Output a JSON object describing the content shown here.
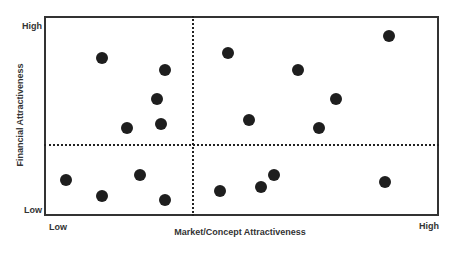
{
  "chart_data": {
    "type": "scatter",
    "title": "",
    "xlabel": "Market/Concept Attractiveness",
    "ylabel": "Financial Attractiveness",
    "x_tick_labels": {
      "low": "Low",
      "high": "High"
    },
    "y_tick_labels": {
      "low": "Low",
      "high": "High"
    },
    "xlim": [
      0,
      10
    ],
    "ylim": [
      0,
      10
    ],
    "grid": false,
    "legend": null,
    "quadrant_dividers": {
      "x": 3.76,
      "y": 3.55,
      "style": "dotted"
    },
    "points": [
      {
        "x": 1.47,
        "y": 7.9
      },
      {
        "x": 3.06,
        "y": 7.3
      },
      {
        "x": 2.86,
        "y": 5.85
      },
      {
        "x": 2.96,
        "y": 4.6
      },
      {
        "x": 2.1,
        "y": 4.4
      },
      {
        "x": 4.66,
        "y": 8.15
      },
      {
        "x": 6.43,
        "y": 7.3
      },
      {
        "x": 7.39,
        "y": 5.85
      },
      {
        "x": 5.19,
        "y": 4.8
      },
      {
        "x": 6.96,
        "y": 4.4
      },
      {
        "x": 8.73,
        "y": 9.0
      },
      {
        "x": 0.56,
        "y": 1.8
      },
      {
        "x": 1.47,
        "y": 1.0
      },
      {
        "x": 2.43,
        "y": 2.05
      },
      {
        "x": 3.06,
        "y": 0.8
      },
      {
        "x": 4.46,
        "y": 1.25
      },
      {
        "x": 5.49,
        "y": 1.45
      },
      {
        "x": 5.82,
        "y": 2.05
      },
      {
        "x": 8.63,
        "y": 1.7
      }
    ]
  },
  "labels": {
    "y_high": "High",
    "y_low": "Low",
    "x_low": "Low",
    "x_high": "High",
    "xlabel": "Market/Concept Attractiveness",
    "ylabel": "Financial Attractiveness"
  },
  "colors": {
    "point": "#1e1e1e",
    "frame": "#333333"
  }
}
